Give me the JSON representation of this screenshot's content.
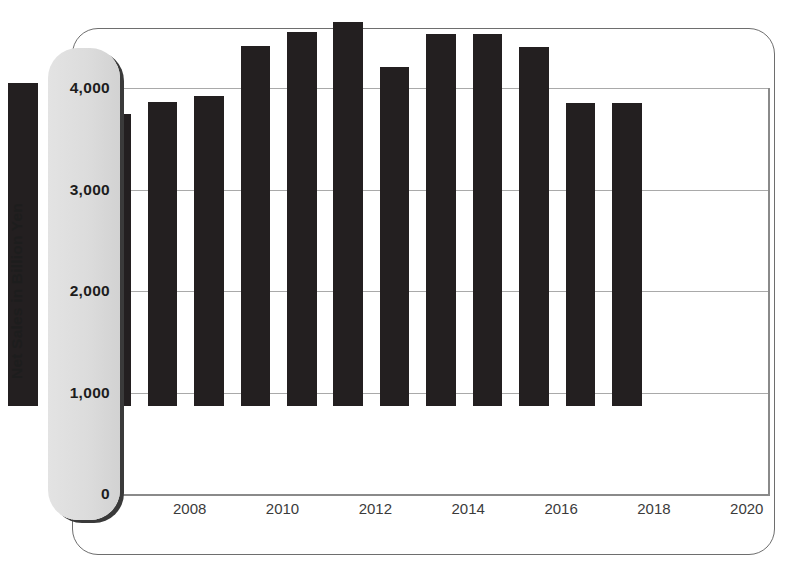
{
  "chart_data": {
    "type": "bar",
    "title": "",
    "xlabel": "",
    "ylabel": "Net Sales in Billion Yen",
    "ylim": [
      0,
      4000
    ],
    "yticks": [
      0,
      1000,
      2000,
      3000,
      4000
    ],
    "ytick_labels": [
      "0",
      "1,000",
      "2,000",
      "3,000",
      "4,000"
    ],
    "grid": true,
    "legend": "none",
    "bar_color": "#231f20",
    "categories": [
      "2007",
      "2008",
      "2009",
      "2010",
      "2011",
      "2012",
      "2013",
      "2014",
      "2015",
      "2016",
      "2017",
      "2018",
      "2019",
      "2020"
    ],
    "visible_xtick_labels": [
      "2008",
      "2010",
      "2012",
      "2014",
      "2016",
      "2018",
      "2020"
    ],
    "values": [
      3180,
      2510,
      2880,
      3000,
      3050,
      3550,
      3680,
      3780,
      3340,
      3670,
      3670,
      3540,
      2990,
      2990
    ],
    "series": [
      {
        "name": "Net Sales",
        "values": [
          3180,
          2510,
          2880,
          3000,
          3050,
          3550,
          3680,
          3780,
          3340,
          3670,
          3670,
          3540,
          2990,
          2990
        ]
      }
    ],
    "points": [
      {
        "category": "2007",
        "value": 3180,
        "labeled": false
      },
      {
        "category": "2008",
        "value": 2510,
        "labeled": true
      },
      {
        "category": "2009",
        "value": 2880,
        "labeled": false
      },
      {
        "category": "2010",
        "value": 3000,
        "labeled": true
      },
      {
        "category": "2011",
        "value": 3050,
        "labeled": false
      },
      {
        "category": "2012",
        "value": 3550,
        "labeled": true
      },
      {
        "category": "2013",
        "value": 3680,
        "labeled": false
      },
      {
        "category": "2014",
        "value": 3780,
        "labeled": true
      },
      {
        "category": "2015",
        "value": 3340,
        "labeled": false
      },
      {
        "category": "2016",
        "value": 3670,
        "labeled": true
      },
      {
        "category": "2017",
        "value": 3670,
        "labeled": false
      },
      {
        "category": "2018",
        "value": 3540,
        "labeled": true
      },
      {
        "category": "2019",
        "value": 2990,
        "labeled": false
      },
      {
        "category": "2020",
        "value": 2990,
        "labeled": true
      }
    ]
  },
  "axis": {
    "y_title": "Net Sales in Billion Yen",
    "ticks": [
      {
        "label": "4,000",
        "value": 4000
      },
      {
        "label": "3,000",
        "value": 3000
      },
      {
        "label": "2,000",
        "value": 2000
      },
      {
        "label": "1,000",
        "value": 1000
      },
      {
        "label": "0",
        "value": 0
      }
    ],
    "x_labels": [
      {
        "label": "2008",
        "index": 1
      },
      {
        "label": "2010",
        "index": 3
      },
      {
        "label": "2012",
        "index": 5
      },
      {
        "label": "2014",
        "index": 7
      },
      {
        "label": "2016",
        "index": 9
      },
      {
        "label": "2018",
        "index": 11
      },
      {
        "label": "2020",
        "index": 13
      }
    ]
  },
  "caption": {
    "text": ""
  },
  "colors": {
    "bar": "#231f20",
    "gridline": "#a9a9a9",
    "frame": "#6e6e6e",
    "panel": "#dcdcdc",
    "panel_shadow": "#3a3a3a",
    "text": "#1d1d1d"
  }
}
